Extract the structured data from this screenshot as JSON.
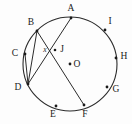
{
  "figure": {
    "colors": {
      "stroke": "#2b2b2b",
      "label": "#1a1a1a",
      "background": "#fdfdfd"
    },
    "circle": {
      "center_label": "O",
      "center_x": 70,
      "center_y": 64,
      "radius": 47
    },
    "points": [
      {
        "id": "A",
        "label": "A",
        "x": 71,
        "y": 18,
        "label_x": 71,
        "label_y": 9
      },
      {
        "id": "B",
        "label": "B",
        "x": 37,
        "y": 31,
        "label_x": 31,
        "label_y": 23
      },
      {
        "id": "C",
        "label": "C",
        "x": 25,
        "y": 54,
        "label_x": 15,
        "label_y": 54
      },
      {
        "id": "D",
        "label": "D",
        "x": 28,
        "y": 84,
        "label_x": 18,
        "label_y": 88
      },
      {
        "id": "E",
        "label": "E",
        "x": 56,
        "y": 106,
        "label_x": 53,
        "label_y": 115
      },
      {
        "id": "F",
        "label": "F",
        "x": 84,
        "y": 105,
        "label_x": 85,
        "label_y": 115
      },
      {
        "id": "G",
        "label": "G",
        "x": 107,
        "y": 87,
        "label_x": 116,
        "label_y": 90
      },
      {
        "id": "H",
        "label": "H",
        "x": 116,
        "y": 58,
        "label_x": 124,
        "label_y": 57
      },
      {
        "id": "I",
        "label": "I",
        "x": 105,
        "y": 30,
        "label_x": 110,
        "label_y": 22
      }
    ],
    "intersection": {
      "id": "J",
      "label": "J",
      "x": 55,
      "y": 50,
      "label_x": 62,
      "label_y": 50
    },
    "angle_marker": {
      "label": "x",
      "x": 45,
      "y": 50
    },
    "chords": [
      {
        "name": "chord-B-F",
        "from": "B",
        "to": "F"
      },
      {
        "name": "chord-A-D",
        "from": "A",
        "to": "D"
      },
      {
        "name": "chord-B-D",
        "from": "B",
        "to": "D"
      },
      {
        "name": "chord-C-D",
        "from": "C",
        "to": "D"
      }
    ]
  }
}
